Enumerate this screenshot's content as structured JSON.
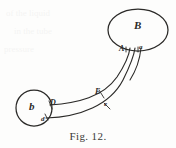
{
  "figure": {
    "caption": "Fig. 12.",
    "ink_color": "#2b2a28",
    "paper_color": "#fdfdfc",
    "labels": {
      "vessel_large": "B",
      "vessel_small": "b",
      "tube_top_left": "A",
      "tube_top_right": "a",
      "tube_mid_upper": "E",
      "tube_mid_lower": "e",
      "tube_base_upper": "D",
      "tube_base_lower": "d"
    },
    "geometry": {
      "large_ellipse": {
        "cx": 138,
        "cy": 30,
        "rx": 30,
        "ry": 21
      },
      "small_circle": {
        "cx": 34,
        "cy": 108,
        "r": 18
      },
      "tube_upper_path": "M 50 105 C 78 103, 104 96, 118 76 C 126 65, 129 56, 130 48",
      "tube_lower_path": "M 47 118 C 80 116, 110 104, 122 80 C 129 66, 133 55, 134 48",
      "tube_right_edge_path": "M 140 48 C 139 58, 136 68, 129 79"
    }
  },
  "bleed_through": {
    "line1": "of the liquid",
    "line2": "in the tube",
    "line3": "pressure"
  }
}
